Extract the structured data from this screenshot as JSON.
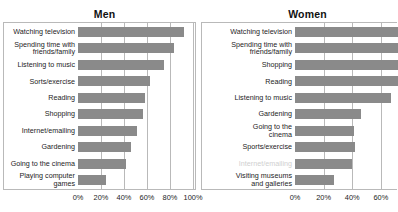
{
  "cut_header": "descenders of a clipped headline row",
  "panels": {
    "men": {
      "title": "Men",
      "axis_ticks": [
        "0%",
        "20%",
        "40%",
        "60%",
        "80%",
        "100%"
      ]
    },
    "women": {
      "title": "Women",
      "axis_ticks": [
        "0%",
        "20%",
        "40%",
        "60%"
      ]
    }
  },
  "chart_data": [
    {
      "type": "bar",
      "title": "Men",
      "orientation": "horizontal",
      "xlabel": "",
      "ylabel": "",
      "xlim": [
        0,
        100
      ],
      "xticks": [
        0,
        20,
        40,
        60,
        80,
        100
      ],
      "xtick_labels": [
        "0%",
        "20%",
        "40%",
        "60%",
        "80%",
        "100%"
      ],
      "grid": true,
      "legend": "none",
      "bar_color": "#8a8a8a",
      "categories": [
        "Watching television",
        "Spending time with\nfriends/family",
        "Listening to music",
        "Sorts/exercise",
        "Reading",
        "Shopping",
        "Internet/emailing",
        "Gardening",
        "Going to the cinema",
        "Playing computer\ngames"
      ],
      "values": [
        90,
        81,
        73,
        61,
        57,
        55,
        50,
        45,
        41,
        24
      ]
    },
    {
      "type": "bar",
      "title": "Women",
      "orientation": "horizontal",
      "xlabel": "",
      "ylabel": "",
      "xlim": [
        0,
        72
      ],
      "xticks": [
        0,
        20,
        40,
        60
      ],
      "xtick_labels": [
        "0%",
        "20%",
        "40%",
        "60%"
      ],
      "grid": true,
      "legend": "none",
      "bar_color": "#8a8a8a",
      "note": "Top four bars are clipped by the right edge of the image.",
      "categories": [
        "Watching television",
        "Spending time with\nfriends/family",
        "Shopping",
        "Reading",
        "Listening to music",
        "Gardening",
        "Going to the\ncinema",
        "Sports/exercise",
        "Internet/emailing",
        "Visiting museums\nand galleries"
      ],
      "values": [
        72,
        72,
        72,
        72,
        67,
        46,
        41,
        42,
        40,
        27
      ],
      "clipped_flags": [
        true,
        true,
        true,
        true,
        false,
        false,
        false,
        false,
        false,
        false
      ],
      "faint_flags": [
        false,
        false,
        false,
        false,
        false,
        false,
        false,
        false,
        true,
        false
      ]
    }
  ]
}
